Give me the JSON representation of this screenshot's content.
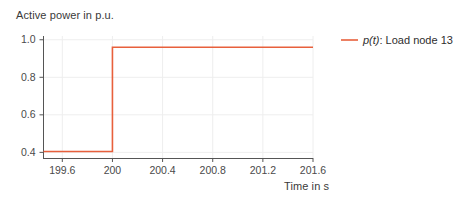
{
  "chart_data": {
    "type": "line",
    "title": "",
    "ylabel": "Active power in p.u.",
    "xlabel": "Time in s",
    "xlim": [
      199.45,
      201.6
    ],
    "ylim": [
      0.37,
      1.02
    ],
    "xticks": [
      199.6,
      200,
      200.4,
      200.8,
      201.2,
      201.6
    ],
    "xtick_labels": [
      "199.6",
      "200",
      "200.4",
      "200.8",
      "201.2",
      "201.6"
    ],
    "yticks": [
      0.4,
      0.6,
      0.8,
      1.0
    ],
    "ytick_labels": [
      "0.4",
      "0.6",
      "0.8",
      "1.0"
    ],
    "grid": true,
    "legend_position": "right",
    "series": [
      {
        "name": "p(t): Load node 13",
        "name_var": "p(t)",
        "name_rest": ": Load node 13",
        "color": "#e8603c",
        "x": [
          199.45,
          200.0,
          200.0,
          201.6
        ],
        "values": [
          0.405,
          0.405,
          0.96,
          0.96
        ]
      }
    ]
  },
  "legend": {
    "entries": [
      {
        "var": "p(t)",
        "rest": ": Load node 13",
        "color": "#e8603c"
      }
    ]
  },
  "colors": {
    "series": "#e8603c",
    "axis": "#555555",
    "grid": "#eeeeee",
    "text": "#3a3a3a",
    "background": "#ffffff"
  }
}
